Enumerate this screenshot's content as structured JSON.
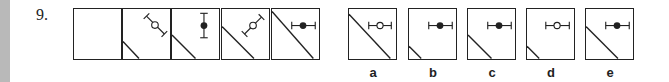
{
  "question": {
    "number": "9.",
    "series_label": "sequence",
    "series": [
      {
        "index": 1,
        "line_size": "none",
        "symbol": "none",
        "symbol_orientation": "none"
      },
      {
        "index": 2,
        "line_size": "small",
        "symbol": "open-circle-error-bar",
        "symbol_orientation": "diagonal-down-right"
      },
      {
        "index": 3,
        "line_size": "medium",
        "symbol": "filled-circle-error-bar",
        "symbol_orientation": "vertical"
      },
      {
        "index": 4,
        "line_size": "large",
        "symbol": "open-circle-error-bar",
        "symbol_orientation": "diagonal-up-right"
      },
      {
        "index": 5,
        "line_size": "full",
        "symbol": "filled-circle-error-bar",
        "symbol_orientation": "horizontal"
      }
    ],
    "options": [
      {
        "label": "a",
        "line_size": "full",
        "symbol": "open-circle-error-bar",
        "symbol_orientation": "horizontal"
      },
      {
        "label": "b",
        "line_size": "small",
        "symbol": "filled-circle-error-bar",
        "symbol_orientation": "horizontal"
      },
      {
        "label": "c",
        "line_size": "medium",
        "symbol": "filled-circle-error-bar",
        "symbol_orientation": "horizontal"
      },
      {
        "label": "d",
        "line_size": "small",
        "symbol": "open-circle-error-bar",
        "symbol_orientation": "horizontal"
      },
      {
        "label": "e",
        "line_size": "large",
        "symbol": "filled-circle-error-bar",
        "symbol_orientation": "horizontal"
      }
    ]
  },
  "colors": {
    "ink": "#222222",
    "margin_strip": "#b9b9b9",
    "background": "#ffffff"
  }
}
